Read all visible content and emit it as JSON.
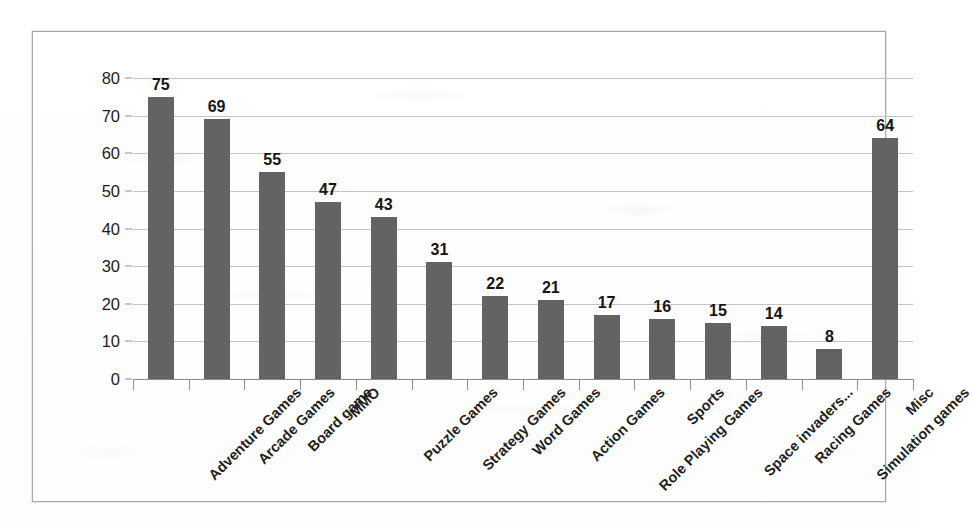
{
  "chart_data": {
    "type": "bar",
    "title": "",
    "subtitle": "",
    "xlabel": "",
    "ylabel": "",
    "ylim": [
      0,
      80
    ],
    "ytick_step": 10,
    "yticks": [
      80,
      70,
      60,
      50,
      40,
      30,
      20,
      10,
      0
    ],
    "grid": true,
    "legend": false,
    "legend_position": "none",
    "data_labels": true,
    "orientation": "vertical",
    "bar_color": "#636363",
    "categories": [
      "Adventure Games",
      "Arcade Games",
      "Board game",
      "MMO",
      "Puzzle Games",
      "Strategy Games",
      "Word Games",
      "Action Games",
      "Role Playing Games",
      "Sports",
      "Space invaders...",
      "Racing Games",
      "Simulation games",
      "Misc"
    ],
    "values": [
      75,
      69,
      55,
      47,
      43,
      31,
      22,
      21,
      17,
      16,
      15,
      14,
      8,
      64
    ]
  },
  "colors": {
    "bar": "#636363",
    "gridline": "#b9b9b9",
    "axis": "#8a8a8a",
    "frame": "#a8a8a8",
    "text": "#1c1c1c",
    "background": "#ffffff"
  }
}
